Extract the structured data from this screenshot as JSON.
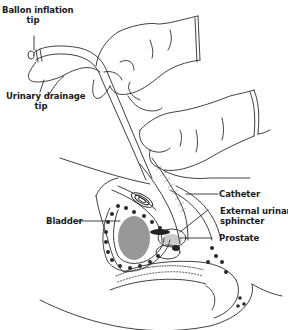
{
  "figure": {
    "colors": {
      "line": "#2a2a2a",
      "shade": "#555555",
      "background": "#ffffff"
    },
    "labels": {
      "balloon_tip": {
        "line1": "Ballon inflation",
        "line2": "tip"
      },
      "drainage_tip": {
        "line1": "Urinary drainage",
        "line2": "tip"
      },
      "catheter": "Catheter",
      "sphincter": {
        "line1": "External urinary",
        "line2": "sphincter"
      },
      "prostate": "Prostate",
      "bladder": "Bladder"
    }
  }
}
